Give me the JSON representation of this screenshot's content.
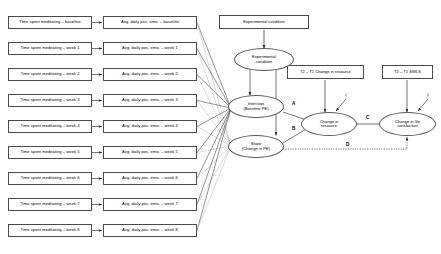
{
  "diagram": {
    "type": "structural-equation-model",
    "canvas": {
      "width": 441,
      "height": 254,
      "background": "#ffffff"
    },
    "stroke_color": "#4a4a4a",
    "faint_stroke_color": "#b9b9b9"
  },
  "indicator_rows": [
    {
      "predictor": "Time spent meditating – baseline",
      "outcome": "Avg. daily pos. emo. – baseline",
      "y": 16
    },
    {
      "predictor": "Time spent meditating – week 1",
      "outcome": "Avg. daily pos. emo. – week 1",
      "y": 42
    },
    {
      "predictor": "Time spent meditating – week 2",
      "outcome": "Avg. daily pos. emo. – week 2",
      "y": 68
    },
    {
      "predictor": "Time spent meditating – week 3",
      "outcome": "Avg. daily pos. emo. – week 3",
      "y": 94
    },
    {
      "predictor": "Time spent meditating – week 4",
      "outcome": "Avg. daily pos. emo. – week 4",
      "y": 120
    },
    {
      "predictor": "Time spent meditating – week 5",
      "outcome": "Avg. daily pos. emo. – week 5",
      "y": 146
    },
    {
      "predictor": "Time spent meditating – week 6",
      "outcome": "Avg. daily pos. emo. – week 6",
      "y": 172
    },
    {
      "predictor": "Time spent meditating – week 7",
      "outcome": "Avg. daily pos. emo. – week 7",
      "y": 198
    },
    {
      "predictor": "Time spent meditating – week 8",
      "outcome": "Avg. daily pos. emo. – week 8",
      "y": 224
    }
  ],
  "observed_boxes": {
    "experimental_condition": "Experimental condition",
    "change_in_resource": "T2 – T1 Change in resource",
    "swls": "T2 – T1 SWLS"
  },
  "latent_variables": {
    "experimental_condition": {
      "line1": "Experimental",
      "line2": "condition"
    },
    "intercept": {
      "line1": "Intercept",
      "line2": "(Baseline PE)"
    },
    "slope": {
      "line1": "Slope",
      "line2": "(Change in PE)"
    },
    "change_in_resource": {
      "line1": "Change in",
      "line2": "resource"
    },
    "change_in_life_satisfaction": {
      "line1": "Change in life",
      "line2": "satisfaction"
    }
  },
  "path_labels": {
    "a": "A",
    "b": "B",
    "c": "C",
    "d": "D"
  },
  "disturbances": {
    "resource": "ζ",
    "life_satisfaction": "ζ"
  }
}
